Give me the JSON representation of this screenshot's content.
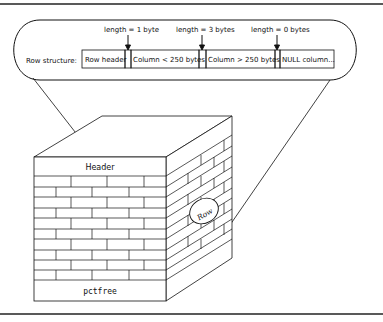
{
  "diagram": {
    "callout": {
      "row_structure_label": "Row structure:",
      "cells": [
        {
          "label": "Row header"
        },
        {
          "label": "Column < 250 bytes"
        },
        {
          "label": "Column > 250 bytes"
        },
        {
          "label": "NULL column..."
        }
      ],
      "length_labels": [
        {
          "label": "length = 1 byte"
        },
        {
          "label": "length = 3 bytes"
        },
        {
          "label": "length = 0 bytes"
        }
      ]
    },
    "block": {
      "header_label": "Header",
      "footer_label": "pctfree",
      "row_label": "Row"
    },
    "colors": {
      "line": "#111111",
      "background": "#ffffff"
    }
  }
}
